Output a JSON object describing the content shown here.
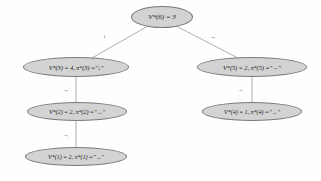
{
  "figure": {
    "type": "tree-diagram",
    "background_color": "#fefefe",
    "node_fill": "#d3d3d3",
    "node_border": "#7a7a7a",
    "edge_color": "#8c8c8c"
  },
  "nodes": [
    {
      "id": "n6",
      "label": "V*(6) = 3"
    },
    {
      "id": "n3",
      "label": "V*(3) = 4, π*(3) =\"↓\""
    },
    {
      "id": "n2",
      "label": "V*(2) = 2, π*(2) =\"→\""
    },
    {
      "id": "n1",
      "label": "V*(1) = 2, π*(1) =\"→\""
    },
    {
      "id": "n5",
      "label": "V*(5) = 2, π*(5) =\"→\""
    },
    {
      "id": "n4",
      "label": "V*(4) = 1, π*(4) =\"→\""
    }
  ],
  "edges": [
    {
      "from": "n6",
      "to": "n3",
      "label": "↓"
    },
    {
      "from": "n6",
      "to": "n5",
      "label": "→"
    },
    {
      "from": "n3",
      "to": "n2",
      "label": "→"
    },
    {
      "from": "n2",
      "to": "n1",
      "label": "→"
    },
    {
      "from": "n5",
      "to": "n4",
      "label": "→"
    }
  ]
}
